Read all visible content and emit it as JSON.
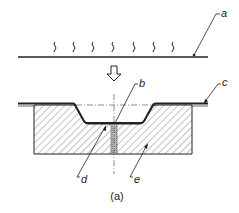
{
  "figure": {
    "caption": "(a)",
    "labels": {
      "a": "a",
      "b": "b",
      "c": "c",
      "d": "d",
      "e": "e"
    },
    "heat_symbol_count": 7,
    "colors": {
      "stroke": "#222222",
      "hatch": "#555555",
      "background": "#ffffff"
    }
  }
}
